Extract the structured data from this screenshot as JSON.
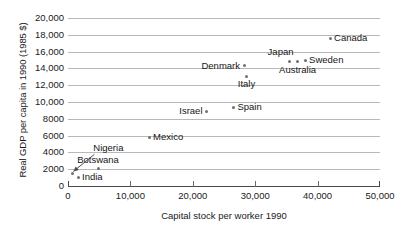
{
  "chart_data": {
    "type": "scatter",
    "title": "",
    "xlabel": "Capital stock per worker 1990",
    "ylabel": "Real GDP per capita in 1990 (1985 $)",
    "xlim": [
      0,
      50000
    ],
    "ylim": [
      0,
      20000
    ],
    "xticks": [
      "0",
      "10,000",
      "20,000",
      "30,000",
      "40,000",
      "50,000"
    ],
    "xtick_values": [
      0,
      10000,
      20000,
      30000,
      40000,
      50000
    ],
    "yticks": [
      "0",
      "2000",
      "4000",
      "6000",
      "8000",
      "10,000",
      "12,000",
      "14,000",
      "16,000",
      "18,000",
      "20,000"
    ],
    "ytick_values": [
      0,
      2000,
      4000,
      6000,
      8000,
      10000,
      12000,
      14000,
      16000,
      18000,
      20000
    ],
    "grid": "horizontal",
    "legend": "none",
    "points": [
      {
        "name": "Canada",
        "x": 42000,
        "y": 17600,
        "label_pos": "right"
      },
      {
        "name": "Sweden",
        "x": 38000,
        "y": 15000,
        "label_pos": "right"
      },
      {
        "name": "Japan",
        "x": 35500,
        "y": 14800,
        "label_pos": "above-left"
      },
      {
        "name": "Australia",
        "x": 36800,
        "y": 14800,
        "label_pos": "below"
      },
      {
        "name": "Denmark",
        "x": 28200,
        "y": 14300,
        "label_pos": "left"
      },
      {
        "name": "Italy",
        "x": 28600,
        "y": 13100,
        "label_pos": "below"
      },
      {
        "name": "Spain",
        "x": 26500,
        "y": 9400,
        "label_pos": "right"
      },
      {
        "name": "Israel",
        "x": 22200,
        "y": 8900,
        "label_pos": "left"
      },
      {
        "name": "Mexico",
        "x": 13000,
        "y": 5800,
        "label_pos": "right"
      },
      {
        "name": "Botswana",
        "x": 4800,
        "y": 2100,
        "label_pos": "above"
      },
      {
        "name": "Nigeria",
        "x": 700,
        "y": 1500,
        "label_pos": "leader"
      },
      {
        "name": "India",
        "x": 1600,
        "y": 1050,
        "label_pos": "right"
      }
    ]
  },
  "colors": {
    "marker": "#6f6f6f",
    "gridline": "#b9b9b9",
    "axis": "#4a4a4a",
    "text": "#161616",
    "background": "#ffffff"
  }
}
